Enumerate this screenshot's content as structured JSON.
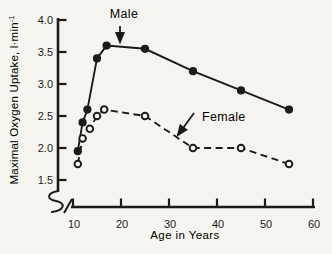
{
  "figure": {
    "background": "#f6f4ef",
    "ink": "#1d1b18"
  },
  "display": {
    "ylabel_base": "Maximal Oxygen Uptake, l·min",
    "ylabel_sup": "-1"
  },
  "chart_data": {
    "type": "line",
    "title": "",
    "xlabel": "Age in Years",
    "ylabel": "Maximal Oxygen Uptake, l·min⁻¹",
    "grid": false,
    "legend": "inline-annotations",
    "x_axis": {
      "min": 10,
      "max": 60,
      "ticks": [
        10,
        20,
        30,
        40,
        50,
        60
      ],
      "tick_labels": [
        "10",
        "20",
        "30",
        "40",
        "50",
        "60"
      ],
      "axis_break_at_origin": true
    },
    "y_axis": {
      "min": 1.5,
      "max": 4.0,
      "ticks": [
        1.5,
        2.0,
        2.5,
        3.0,
        3.5,
        4.0
      ],
      "tick_labels": [
        "1.5",
        "2.0",
        "2.5",
        "3.0",
        "3.5",
        "4.0"
      ],
      "axis_break_at_origin": true
    },
    "series": [
      {
        "name": "Male",
        "line_style": "solid",
        "marker": "filled-circle",
        "points": [
          {
            "age": 11,
            "value": 1.95
          },
          {
            "age": 12,
            "value": 2.4
          },
          {
            "age": 13,
            "value": 2.6
          },
          {
            "age": 15,
            "value": 3.4
          },
          {
            "age": 17,
            "value": 3.6
          },
          {
            "age": 25,
            "value": 3.55
          },
          {
            "age": 35,
            "value": 3.2
          },
          {
            "age": 45,
            "value": 2.9
          },
          {
            "age": 55,
            "value": 2.6
          }
        ]
      },
      {
        "name": "Female",
        "line_style": "dashed",
        "marker": "open-circle",
        "points": [
          {
            "age": 11,
            "value": 1.75
          },
          {
            "age": 12,
            "value": 2.15
          },
          {
            "age": 13.5,
            "value": 2.3
          },
          {
            "age": 15,
            "value": 2.5
          },
          {
            "age": 16.5,
            "value": 2.6
          },
          {
            "age": 25,
            "value": 2.5
          },
          {
            "age": 35,
            "value": 2.0
          },
          {
            "age": 45,
            "value": 2.0
          },
          {
            "age": 55,
            "value": 1.75
          }
        ]
      }
    ],
    "annotations": [
      {
        "label": "Male",
        "target_series": "Male",
        "arrow_direction": "down"
      },
      {
        "label": "Female",
        "target_series": "Female",
        "arrow_direction": "down-left"
      }
    ]
  }
}
